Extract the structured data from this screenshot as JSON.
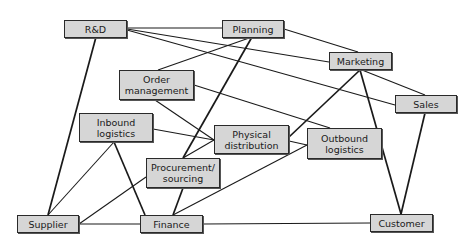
{
  "diagram": {
    "type": "network",
    "nodes": {
      "rd": "R&D",
      "planning": "Planning",
      "marketing": "Marketing",
      "sales": "Sales",
      "order_management": "Order\nmanagement",
      "inbound_logistics": "Inbound\nlogistics",
      "physical_distribution": "Physical\ndistribution",
      "outbound_logistics": "Outbound\nlogistics",
      "procurement_sourcing": "Procurement/\nsourcing",
      "supplier": "Supplier",
      "finance": "Finance",
      "customer": "Customer"
    },
    "edges": [
      [
        "R&D",
        "Planning"
      ],
      [
        "R&D",
        "Marketing"
      ],
      [
        "R&D",
        "Sales"
      ],
      [
        "R&D",
        "Supplier"
      ],
      [
        "Planning",
        "Marketing"
      ],
      [
        "Planning",
        "Order management"
      ],
      [
        "Planning",
        "Procurement/sourcing"
      ],
      [
        "Marketing",
        "Sales"
      ],
      [
        "Marketing",
        "Physical distribution"
      ],
      [
        "Marketing",
        "Customer"
      ],
      [
        "Order management",
        "Physical distribution"
      ],
      [
        "Order management",
        "Outbound logistics"
      ],
      [
        "Inbound logistics",
        "Physical distribution"
      ],
      [
        "Inbound logistics",
        "Supplier"
      ],
      [
        "Inbound logistics",
        "Finance"
      ],
      [
        "Physical distribution",
        "Outbound logistics"
      ],
      [
        "Physical distribution",
        "Procurement/sourcing"
      ],
      [
        "Procurement/sourcing",
        "Supplier"
      ],
      [
        "Procurement/sourcing",
        "Finance"
      ],
      [
        "Outbound logistics",
        "Finance"
      ],
      [
        "Sales",
        "Customer"
      ],
      [
        "Supplier",
        "Finance"
      ],
      [
        "Finance",
        "Customer"
      ]
    ],
    "colors": {
      "node_fill": "#d6d6d6",
      "node_border": "#2a2a2a",
      "line": "#1a1a1a"
    }
  }
}
